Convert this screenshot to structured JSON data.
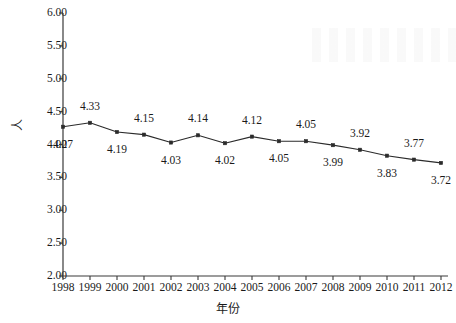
{
  "chart_data": {
    "type": "line",
    "title": "",
    "subtitle": "",
    "xlabel": "年份",
    "ylabel": "人",
    "categories": [
      "1998",
      "1999",
      "2000",
      "2001",
      "2002",
      "2003",
      "2004",
      "2005",
      "2006",
      "2007",
      "2008",
      "2009",
      "2010",
      "2011",
      "2012"
    ],
    "values": [
      4.27,
      4.33,
      4.19,
      4.15,
      4.03,
      4.14,
      4.02,
      4.12,
      4.05,
      4.05,
      3.99,
      3.92,
      3.83,
      3.77,
      3.72
    ],
    "point_labels": [
      "4.27",
      "4.33",
      "4.19",
      "4.15",
      "4.03",
      "4.14",
      "4.02",
      "4.12",
      "4.05",
      "4.05",
      "3.99",
      "3.92",
      "3.83",
      "3.77",
      "3.72"
    ],
    "label_positions": [
      "below",
      "above",
      "below",
      "above",
      "below",
      "above",
      "below",
      "above",
      "below",
      "above",
      "below",
      "above",
      "below",
      "above",
      "below"
    ],
    "ylim": [
      2.0,
      6.0
    ],
    "ytick_values": [
      6.0,
      5.5,
      5.0,
      4.5,
      4.0,
      3.5,
      3.0,
      2.5,
      2.0
    ],
    "ytick_labels": [
      "6.00",
      "5.50",
      "5.00",
      "4.50",
      "4.00",
      "3.50",
      "3.00",
      "2.50",
      "2.00"
    ],
    "xtick_labels": [
      "1998",
      "1999",
      "2000",
      "2001",
      "2002",
      "2003",
      "2004",
      "2005",
      "2006",
      "2007",
      "2008",
      "2009",
      "2010",
      "2011",
      "2012"
    ],
    "grid": false,
    "legend": false,
    "legend_position": "none",
    "series": [
      {
        "name": "",
        "values": [
          4.27,
          4.33,
          4.19,
          4.15,
          4.03,
          4.14,
          4.02,
          4.12,
          4.05,
          4.05,
          3.99,
          3.92,
          3.83,
          3.77,
          3.72
        ],
        "marker": "square",
        "line_color": "#2b2b2b",
        "marker_color": "#2b2b2b"
      }
    ],
    "colors": {
      "background": "#ffffff",
      "axis": "#3a3a3a",
      "line": "#2b2b2b",
      "marker": "#2b2b2b",
      "text": "#1a1a1a"
    }
  }
}
